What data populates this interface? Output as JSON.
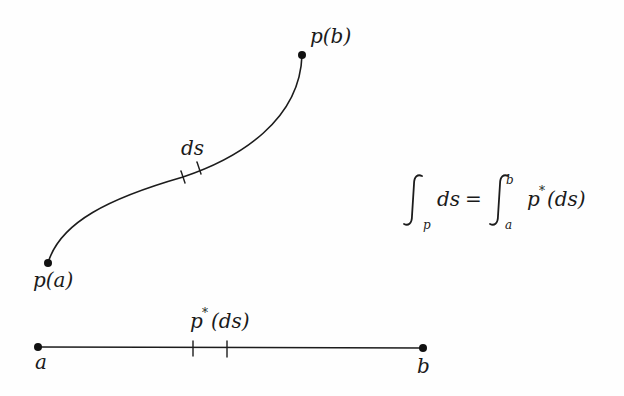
{
  "diagram": {
    "curve": {
      "start_label": "p(a)",
      "end_label": "p(b)",
      "element_label": "ds"
    },
    "segment": {
      "left_label": "a",
      "right_label": "b",
      "element_label": "p*(ds)",
      "element_label_base": "p",
      "element_label_sup": "*",
      "element_label_rest": "(ds)"
    },
    "formula": {
      "lhs_integral_sub": "p",
      "lhs_integrand": "ds",
      "equals": "=",
      "rhs_integral_sub": "a",
      "rhs_integral_sup": "b",
      "rhs_integrand_base": "p",
      "rhs_integrand_sup": "*",
      "rhs_integrand_rest": "(ds)",
      "text": "∫_p ds = ∫_a^b p*(ds)"
    },
    "colors": {
      "ink": "#1c1c1c",
      "background": "#fefefe"
    }
  }
}
